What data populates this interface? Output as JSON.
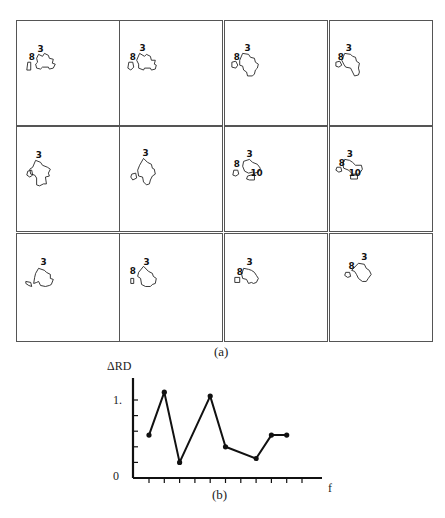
{
  "figure": {
    "caption_a": "(a)",
    "caption_b": "(b)"
  },
  "panels": [
    {
      "row": 0,
      "col": 0,
      "labels": [
        {
          "text": "3",
          "dx": 19,
          "dy": 18
        },
        {
          "text": "8",
          "dx": 10,
          "dy": 26
        }
      ],
      "shape": "M20,20 L24,22 L26,19 L30,21 L31,24 L35,25 L34,29 L37,30 L35,34 L31,35 L30,33 L24,33 L22,35 L18,34 L17,30 L19,28 L18,24 Z M9,28 L12,28 L12,36 L8,36 Z"
    },
    {
      "row": 0,
      "col": 1,
      "labels": [
        {
          "text": "3",
          "dx": 18,
          "dy": 17
        },
        {
          "text": "8",
          "dx": 8,
          "dy": 26
        }
      ],
      "shape": "M18,19 L23,22 L25,20 L29,22 L30,26 L34,26 L33,30 L35,31 L34,35 L30,36 L29,34 L23,34 L22,36 L17,34 L17,30 L15,26 Z M7,28 L11,28 L12,33 L9,36 L6,34 Z"
    },
    {
      "row": 0,
      "col": 2,
      "labels": [
        {
          "text": "3",
          "dx": 18,
          "dy": 17
        },
        {
          "text": "8",
          "dx": 7,
          "dy": 26
        }
      ],
      "shape": "M16,19 L22,20 L24,23 L28,24 L29,28 L32,30 L31,34 L29,36 L28,40 L26,42 L21,42 L20,38 L17,36 L16,32 L13,31 L13,26 Z M5,28 L9,27 L11,31 L9,34 L5,33 Z"
    },
    {
      "row": 0,
      "col": 3,
      "labels": [
        {
          "text": "3",
          "dx": 14,
          "dy": 17
        },
        {
          "text": "8",
          "dx": 6,
          "dy": 26
        }
      ],
      "shape": "M13,19 L19,20 L21,22 L24,23 L25,27 L28,29 L27,34 L28,38 L27,41 L23,42 L21,38 L19,34 L14,33 L12,30 L10,26 Z M4,28 L8,27 L10,31 L7,33 L4,32 Z"
    },
    {
      "row": 1,
      "col": 0,
      "labels": [
        {
          "text": "3",
          "dx": 17,
          "dy": 18
        },
        {
          "text": "8",
          "dx": 0,
          "dy": 0
        }
      ],
      "shape": "M17,20 L22,22 L24,25 L29,27 L32,29 L30,33 L31,36 L27,37 L28,44 L25,44 L21,46 L18,45 L18,38 L16,35 L12,34 L11,29 L14,27 Z M9,31 L13,30 L14,35 L11,37 L8,35 Z"
    },
    {
      "row": 1,
      "col": 1,
      "labels": [
        {
          "text": "3",
          "dx": 21,
          "dy": 16
        },
        {
          "text": "8",
          "dx": 0,
          "dy": 0
        }
      ],
      "shape": "M22,18 L26,22 L30,24 L31,28 L33,29 L34,34 L31,36 L29,40 L28,44 L25,45 L22,42 L21,37 L17,36 L16,30 L18,25 Z M10,34 L14,33 L15,38 L11,40 L9,37 Z"
    },
    {
      "row": 1,
      "col": 2,
      "labels": [
        {
          "text": "3",
          "dx": 20,
          "dy": 17
        },
        {
          "text": "8",
          "dx": 7,
          "dy": 27
        },
        {
          "text": "10",
          "dx": 24,
          "dy": 36
        }
      ],
      "shape": "M17,21 L23,19 L26,22 L31,24 L34,28 L32,32 L28,33 L26,32 L22,33 L18,31 L16,26 Z M7,30 L11,30 L12,34 L9,36 L6,35 Z M21,36 L28,34 L28,40 L23,40 L20,39 Z"
    },
    {
      "row": 1,
      "col": 3,
      "labels": [
        {
          "text": "3",
          "dx": 15,
          "dy": 17
        },
        {
          "text": "8",
          "dx": 7,
          "dy": 26
        },
        {
          "text": "10",
          "dx": 17,
          "dy": 36
        }
      ],
      "shape": "M13,19 L18,20 L21,22 L24,25 L30,25 L31,29 L29,32 L27,34 L21,34 L17,30 L12,28 L11,24 Z M5,27 L9,27 L10,31 L7,32 L4,30 Z M19,35 L26,35 L26,39 L19,39 Z"
    },
    {
      "row": 2,
      "col": 0,
      "labels": [
        {
          "text": "3",
          "dx": 22,
          "dy": 17
        },
        {
          "text": "8",
          "dx": 0,
          "dy": 0
        }
      ],
      "shape": "M20,20 L26,22 L28,24 L32,26 L32,30 L35,31 L33,36 L31,37 L27,38 L22,37 L20,33 L18,34 L15,35 L16,29 L17,25 Z M7,33 L12,34 L13,38 L10,37 L7,35 Z"
    },
    {
      "row": 2,
      "col": 1,
      "labels": [
        {
          "text": "3",
          "dx": 22,
          "dy": 17
        },
        {
          "text": "8",
          "dx": 8,
          "dy": 26
        }
      ],
      "shape": "M22,18 L27,23 L31,25 L32,28 L35,30 L34,35 L31,36 L29,38 L24,38 L20,36 L19,30 L16,28 L17,24 Z M9,30 L12,30 L12,35 L9,35 Z"
    },
    {
      "row": 2,
      "col": 2,
      "labels": [
        {
          "text": "3",
          "dx": 20,
          "dy": 17
        },
        {
          "text": "8",
          "dx": 10,
          "dy": 27
        }
      ],
      "shape": "M17,20 L22,21 L25,22 L28,24 L30,27 L32,30 L30,34 L27,35 L25,34 L22,35 L20,31 L16,30 L15,26 Z M8,29 L13,29 L13,34 L8,34 Z"
    },
    {
      "row": 2,
      "col": 3,
      "labels": [
        {
          "text": "3",
          "dx": 30,
          "dy": 12
        },
        {
          "text": "8",
          "dx": 17,
          "dy": 21
        }
      ],
      "shape": "M27,15 L33,16 L35,20 L38,22 L40,26 L37,30 L35,33 L31,33 L27,30 L25,26 L23,23 L20,22 Z M14,24 L18,24 L19,28 L16,29 L13,27 Z"
    }
  ],
  "chart_data": {
    "type": "line",
    "title": "",
    "xlabel": "f",
    "ylabel": "ΔRD",
    "x": [
      1,
      2,
      3,
      4,
      5,
      6,
      7,
      8,
      9,
      10,
      11
    ],
    "values": [
      0.55,
      1.1,
      0.2,
      null,
      null,
      1.05,
      0.4,
      null,
      0.25,
      0.55,
      0.55
    ],
    "points": [
      {
        "x": 1,
        "y": 0.55
      },
      {
        "x": 2,
        "y": 1.1
      },
      {
        "x": 3,
        "y": 0.2
      },
      {
        "x": 5,
        "y": 1.05
      },
      {
        "x": 6,
        "y": 0.4
      },
      {
        "x": 8,
        "y": 0.25
      },
      {
        "x": 9,
        "y": 0.55
      },
      {
        "x": 10,
        "y": 0.55
      }
    ],
    "y_ticks": [
      {
        "value": 0,
        "label": "0"
      },
      {
        "value": 1,
        "label": "1."
      }
    ],
    "y_minor_ticks": [
      0.2,
      0.4,
      0.6,
      0.8,
      1.0
    ],
    "x_tick_count": 11,
    "ylim": [
      0,
      1.4
    ],
    "grid": false,
    "legend": null
  }
}
